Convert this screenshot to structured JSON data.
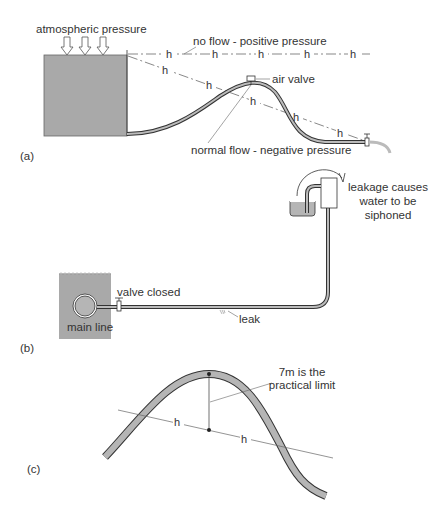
{
  "figure": {
    "parts": [
      {
        "id": "a",
        "label": "(a)",
        "annotations": {
          "atmospheric": "atmospheric pressure",
          "no_flow": "no flow - positive pressure",
          "air_valve": "air valve",
          "normal_flow": "normal flow - negative pressure"
        },
        "head_marker": "h"
      },
      {
        "id": "b",
        "label": "(b)",
        "annotations": {
          "valve_closed": "valve closed",
          "main_line": "main line",
          "leak": "leak",
          "siphon_line1": "leakage causes",
          "siphon_line2": "water to be",
          "siphon_line3": "siphoned"
        }
      },
      {
        "id": "c",
        "label": "(c)",
        "annotations": {
          "limit_line1": "7m is the",
          "limit_line2": "practical limit"
        },
        "head_marker": "h"
      }
    ],
    "colors": {
      "fill_gray": "#a9a9a9",
      "pipe_fill": "#b5b5b5",
      "line": "#333333",
      "leader": "#666666"
    }
  }
}
